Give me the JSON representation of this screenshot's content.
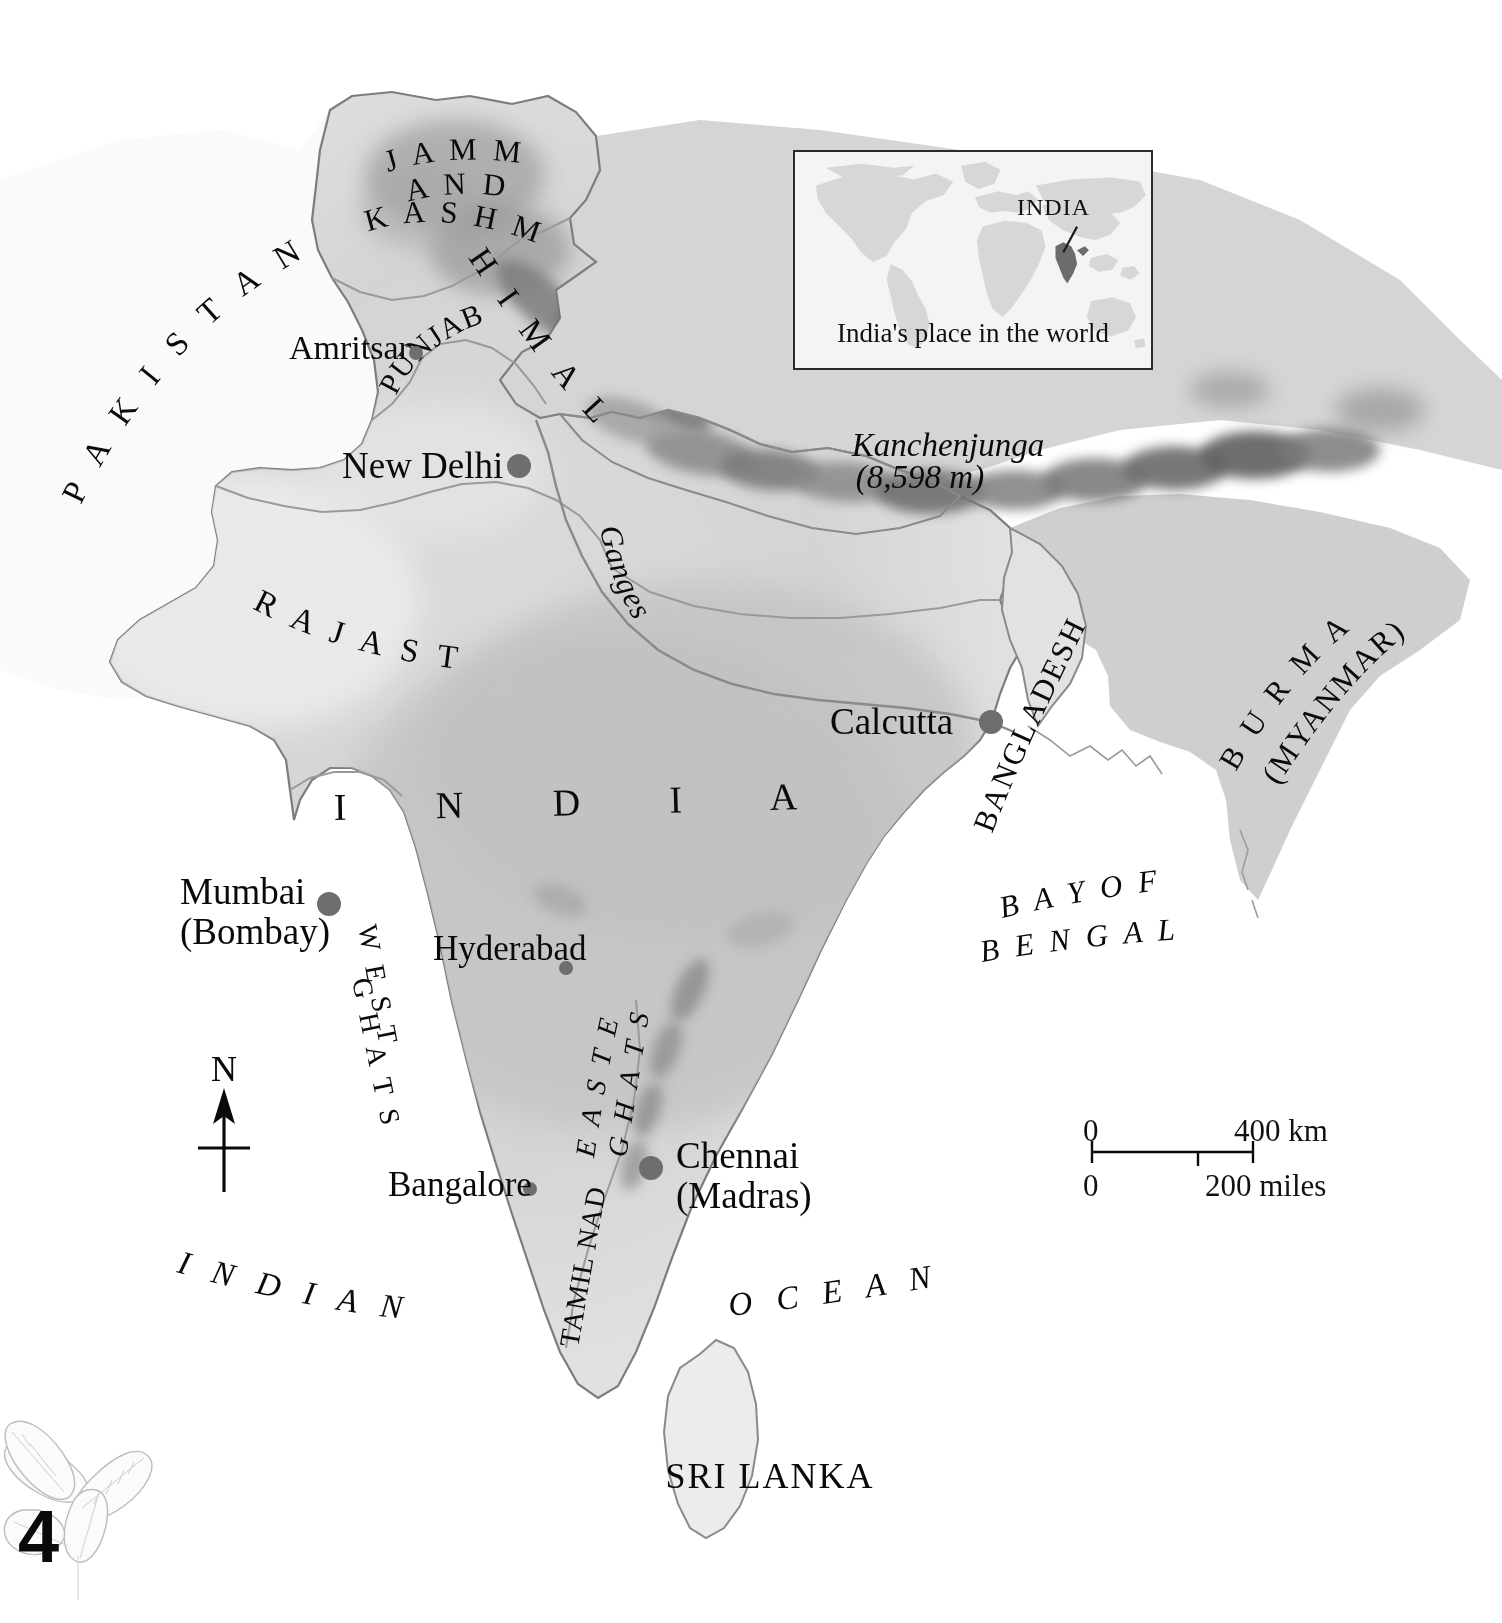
{
  "page": {
    "number": "4",
    "decoration": "tea-leaf-sprig"
  },
  "inset": {
    "caption": "India's place in the world",
    "country_label": "INDIA"
  },
  "map": {
    "main_country": "I N D I A",
    "countries": [
      {
        "name": "PAKISTAN",
        "display": "P A K I S T A N"
      },
      {
        "name": "BANGLADESH",
        "display": "BANGLADESH"
      },
      {
        "name": "BURMA",
        "display": "B U R M A"
      },
      {
        "name": "MYANMAR",
        "display": "(MYANMAR)"
      },
      {
        "name": "SRI LANKA",
        "display": "SRI LANKA"
      }
    ],
    "states": [
      {
        "display": "J A M M U"
      },
      {
        "display": "A N D"
      },
      {
        "display": "K A S H M I R"
      },
      {
        "display": "PUNJAB"
      },
      {
        "display": "R A J A S T H A N"
      },
      {
        "display": "TAMIL NADU"
      }
    ],
    "physical": [
      {
        "display": "H I M A L A Y A S"
      },
      {
        "display": "W E S T E R N"
      },
      {
        "display": "G H A T S"
      },
      {
        "display": "E A S T E R N"
      },
      {
        "display": "G H A T S"
      },
      {
        "display": "Ganges"
      }
    ],
    "peak": {
      "name": "Kanchenjunga",
      "elevation": "(8,598 m)"
    },
    "oceans": [
      {
        "display": "B A Y   O F"
      },
      {
        "display": "B E N G A L"
      },
      {
        "display": "I N D I A N"
      },
      {
        "display": "O C E A N"
      }
    ],
    "cities": [
      {
        "name": "Amritsar",
        "label": "Amritsar",
        "sub": "",
        "dot": "small"
      },
      {
        "name": "New Delhi",
        "label": "New Delhi",
        "sub": "",
        "dot": "large"
      },
      {
        "name": "Calcutta",
        "label": "Calcutta",
        "sub": "",
        "dot": "large"
      },
      {
        "name": "Mumbai",
        "label": "Mumbai",
        "sub": "(Bombay)",
        "dot": "large"
      },
      {
        "name": "Hyderabad",
        "label": "Hyderabad",
        "sub": "",
        "dot": "small"
      },
      {
        "name": "Bangalore",
        "label": "Bangalore",
        "sub": "",
        "dot": "small"
      },
      {
        "name": "Chennai",
        "label": "Chennai",
        "sub": "(Madras)",
        "dot": "large"
      }
    ]
  },
  "scale_bar": {
    "km_start": "0",
    "km_end": "400 km",
    "miles_start": "0",
    "miles_end": "200 miles"
  },
  "compass": {
    "north": "N"
  },
  "colors": {
    "land": "#d8d8d8",
    "land_light": "#e8e8e8",
    "border": "#8a8a8a",
    "text": "#0a0a0a",
    "dot": "#6e6e6e",
    "inset_land": "#d2d2d2",
    "inset_bg": "#f4f4f4",
    "inset_highlight": "#6b6b6b"
  }
}
